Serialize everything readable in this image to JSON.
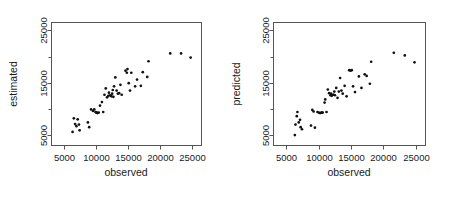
{
  "figure": {
    "background_color": "#ffffff",
    "axis_color": "#555555",
    "point_color": "#111111",
    "panel_count": 2
  },
  "chart_data": [
    {
      "type": "scatter",
      "title": "",
      "xlabel": "observed",
      "ylabel": "estimated",
      "xlim": [
        3000,
        26500
      ],
      "ylim": [
        3000,
        26500
      ],
      "xticks": [
        5000,
        10000,
        15000,
        20000,
        25000
      ],
      "xtick_labels": [
        "5000",
        "10000",
        "15000",
        "20000",
        "25000"
      ],
      "yticks": [
        5000,
        15000,
        25000
      ],
      "ytick_labels": [
        "5000",
        "15000",
        "25000"
      ],
      "yminorticks": [
        10000,
        20000
      ],
      "grid": false,
      "legend": "none",
      "marker": "filled-circle",
      "points": [
        [
          6300,
          5600
        ],
        [
          6500,
          8200
        ],
        [
          6700,
          7100
        ],
        [
          6900,
          6700
        ],
        [
          7100,
          8000
        ],
        [
          7300,
          7000
        ],
        [
          7400,
          5900
        ],
        [
          8700,
          7400
        ],
        [
          8900,
          6500
        ],
        [
          9200,
          9900
        ],
        [
          9500,
          9600
        ],
        [
          9700,
          9900
        ],
        [
          9900,
          9400
        ],
        [
          10000,
          9300
        ],
        [
          10100,
          9300
        ],
        [
          10200,
          9200
        ],
        [
          10400,
          9300
        ],
        [
          10600,
          10600
        ],
        [
          10900,
          11300
        ],
        [
          11100,
          9400
        ],
        [
          11300,
          12700
        ],
        [
          11500,
          13900
        ],
        [
          11700,
          12200
        ],
        [
          11900,
          12500
        ],
        [
          12000,
          13100
        ],
        [
          12200,
          12600
        ],
        [
          12300,
          12500
        ],
        [
          12400,
          12400
        ],
        [
          12500,
          12900
        ],
        [
          12600,
          13600
        ],
        [
          12700,
          12300
        ],
        [
          12800,
          14300
        ],
        [
          13000,
          16000
        ],
        [
          13200,
          13500
        ],
        [
          13400,
          12900
        ],
        [
          13600,
          13000
        ],
        [
          13800,
          14600
        ],
        [
          14000,
          12700
        ],
        [
          14600,
          17300
        ],
        [
          14800,
          16900
        ],
        [
          14900,
          17600
        ],
        [
          15100,
          14900
        ],
        [
          15300,
          13500
        ],
        [
          15500,
          16900
        ],
        [
          16100,
          14300
        ],
        [
          16400,
          15600
        ],
        [
          17000,
          14400
        ],
        [
          17300,
          17000
        ],
        [
          18000,
          16100
        ],
        [
          18200,
          19100
        ],
        [
          21600,
          20600
        ],
        [
          23300,
          20600
        ],
        [
          24800,
          19800
        ]
      ]
    },
    {
      "type": "scatter",
      "title": "",
      "xlabel": "observed",
      "ylabel": "predicted",
      "xlim": [
        3000,
        26500
      ],
      "ylim": [
        3000,
        26500
      ],
      "xticks": [
        5000,
        10000,
        15000,
        20000,
        25000
      ],
      "xtick_labels": [
        "5000",
        "10000",
        "15000",
        "20000",
        "25000"
      ],
      "yticks": [
        5000,
        15000,
        25000
      ],
      "ytick_labels": [
        "5000",
        "15000",
        "25000"
      ],
      "yminorticks": [
        10000,
        20000
      ],
      "grid": false,
      "legend": "none",
      "marker": "filled-circle",
      "points": [
        [
          6300,
          5000
        ],
        [
          6400,
          7000
        ],
        [
          6600,
          8600
        ],
        [
          6700,
          9400
        ],
        [
          6900,
          7400
        ],
        [
          7100,
          7900
        ],
        [
          7200,
          6500
        ],
        [
          7400,
          6100
        ],
        [
          8800,
          6800
        ],
        [
          9000,
          9800
        ],
        [
          9200,
          9500
        ],
        [
          9400,
          6400
        ],
        [
          9800,
          9400
        ],
        [
          10000,
          9300
        ],
        [
          10200,
          9200
        ],
        [
          10400,
          9300
        ],
        [
          10500,
          9300
        ],
        [
          10600,
          9300
        ],
        [
          10900,
          11200
        ],
        [
          11000,
          11800
        ],
        [
          11200,
          9400
        ],
        [
          11400,
          13700
        ],
        [
          11600,
          13000
        ],
        [
          11800,
          12600
        ],
        [
          11900,
          12900
        ],
        [
          12000,
          12500
        ],
        [
          12200,
          12700
        ],
        [
          12300,
          12700
        ],
        [
          12400,
          13300
        ],
        [
          12500,
          12600
        ],
        [
          12700,
          14000
        ],
        [
          12900,
          12100
        ],
        [
          13100,
          13300
        ],
        [
          13300,
          15900
        ],
        [
          13500,
          13500
        ],
        [
          13700,
          12900
        ],
        [
          14000,
          14400
        ],
        [
          14300,
          12400
        ],
        [
          14700,
          17400
        ],
        [
          14900,
          17300
        ],
        [
          15100,
          17400
        ],
        [
          15300,
          14300
        ],
        [
          15600,
          13200
        ],
        [
          16200,
          16200
        ],
        [
          16600,
          14000
        ],
        [
          17100,
          16600
        ],
        [
          17400,
          16300
        ],
        [
          17900,
          14800
        ],
        [
          18100,
          19000
        ],
        [
          21600,
          20700
        ],
        [
          23300,
          20200
        ],
        [
          24800,
          18900
        ]
      ]
    }
  ]
}
